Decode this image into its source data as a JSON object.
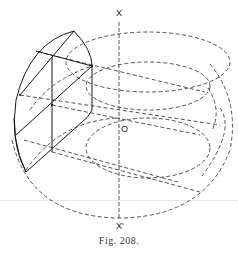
{
  "figure": {
    "caption": "Fig. 208.",
    "labels": {
      "axis_top": "X",
      "axis_bottom": "X'",
      "origin": "O"
    },
    "colors": {
      "ink": "#2a2a2a",
      "background": "#ffffff"
    }
  }
}
